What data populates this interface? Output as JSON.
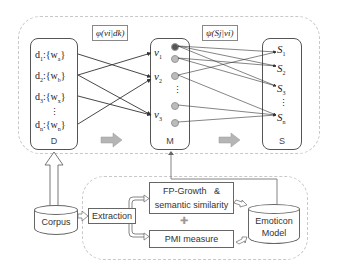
{
  "diagram": {
    "top_panel": {
      "formulas": {
        "phi": "φ(vi|dk)",
        "psi": "ψ(Sj|vi)"
      },
      "columns": {
        "documents": {
          "caption": "D",
          "items": [
            {
              "d": "d",
              "d_sub": "1",
              "w": "{w",
              "w_sub": "a",
              "close": "}"
            },
            {
              "d": "d",
              "d_sub": "2",
              "w": "{w",
              "w_sub": "b",
              "close": "}"
            },
            {
              "d": "d",
              "d_sub": "3",
              "w": "{w",
              "w_sub": "x",
              "close": "}"
            },
            {
              "d": "d",
              "d_sub": "n",
              "w": "{w",
              "w_sub": "n",
              "close": "}"
            }
          ],
          "ellipsis": "⋮"
        },
        "emoticons": {
          "caption": "M",
          "items": [
            {
              "v": "v",
              "v_sub": "1"
            },
            {
              "v": "v",
              "v_sub": "2"
            },
            {
              "v": "v",
              "v_sub": "3"
            }
          ],
          "emoji_count": 5,
          "ellipsis": "⋮"
        },
        "sentiments": {
          "caption": "S",
          "items": [
            {
              "s": "S",
              "s_sub": "1"
            },
            {
              "s": "S",
              "s_sub": "2"
            },
            {
              "s": "S",
              "s_sub": "3"
            },
            {
              "s": "S",
              "s_sub": "n"
            }
          ],
          "ellipsis": "⋮"
        }
      },
      "flow_arrows": [
        "D→M",
        "M→S"
      ]
    },
    "bottom_panel": {
      "corpus": "Corpus",
      "extraction": "Extraction",
      "fp_growth_line1": "FP-Growth   &",
      "fp_growth_line2": "semantic similarity",
      "plus": "✚",
      "pmi": "PMI measure",
      "emoticon_model_line1": "Emoticon",
      "emoticon_model_line2": "Model"
    },
    "colors": {
      "line": "#333333",
      "box_border": "#555555",
      "dashed_border": "#c8c8c8",
      "block_arrow": "#b5b5b5"
    }
  }
}
